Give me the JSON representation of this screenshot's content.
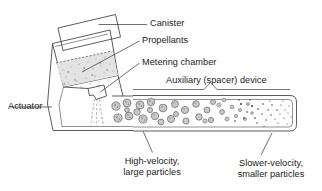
{
  "figure": {
    "background_color": "#ffffff",
    "line_color": "#4a4a4a",
    "text_color": "#1b1b1b",
    "propellant_fill": "#e3e3e3",
    "particle_fill": "#c9c9c9",
    "particle_stroke": "#6d6d6d",
    "mist_color": "#2b2b2b"
  },
  "labels": {
    "canister": "Canister",
    "propellants": "Propellants",
    "metering_chamber": "Metering chamber",
    "auxiliary_device": "Auxiliary (spacer) device",
    "actuator": "Actuator",
    "high_velocity_line1": "High-velocity,",
    "high_velocity_line2": "large particles",
    "slower_velocity_line1": "Slower-velocity,",
    "slower_velocity_line2": "smaller particles"
  },
  "parts": {
    "canister": "pressurized metal canister tilted within actuator",
    "propellants": "stippled liquid propellant region inside canister",
    "metering_chamber": "small valve chamber at canister base",
    "actuator": "plastic boot holding canister and directing spray",
    "spacer": "horizontal holding chamber attached to actuator mouthpiece",
    "plume": "aerosol plume exiting actuator nozzle"
  },
  "particles": {
    "large_zone": "near actuator outlet: large ringed particles",
    "mid_zone": "mid spacer: mixed medium particles",
    "fine_zone": "distal spacer: fine dark mist dots"
  }
}
